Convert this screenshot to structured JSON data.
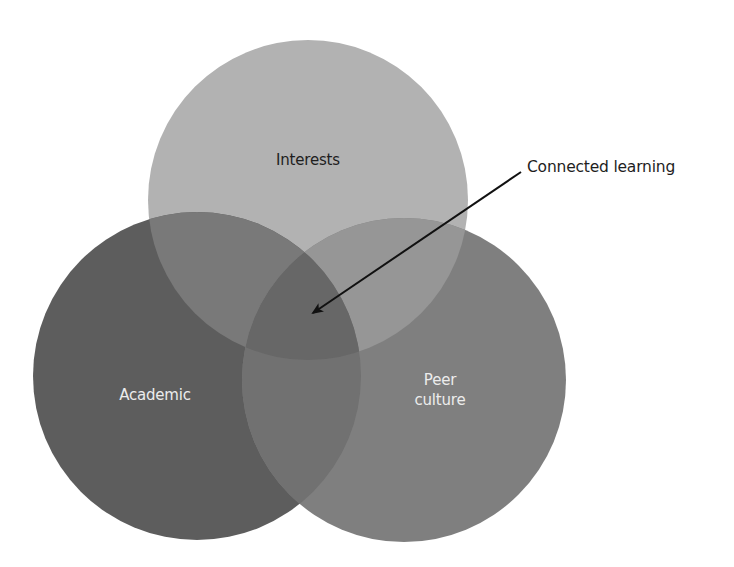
{
  "diagram": {
    "type": "venn",
    "circles": [
      {
        "id": "interests",
        "label": "Interests",
        "cx": 308,
        "cy": 200,
        "r": 160,
        "fill": "#b2b2b2",
        "text_color": "#1e1e1e"
      },
      {
        "id": "academic",
        "label": "Academic",
        "cx": 197,
        "cy": 376,
        "r": 164,
        "fill": "#5d5d5d",
        "text_color": "#ececec"
      },
      {
        "id": "peer_culture",
        "label_lines": [
          "Peer",
          "culture"
        ],
        "cx": 404,
        "cy": 380,
        "r": 162,
        "fill": "#7f7f7f",
        "text_color": "#ececec"
      }
    ],
    "overlap_colors": {
      "interests_academic": "#797979",
      "interests_peer": "#969696",
      "academic_peer": "#717171",
      "all_three": "#676767"
    },
    "annotation": {
      "label": "Connected learning",
      "arrow_from": [
        521,
        172
      ],
      "arrow_to": [
        313,
        313
      ],
      "color": "#111111"
    }
  }
}
